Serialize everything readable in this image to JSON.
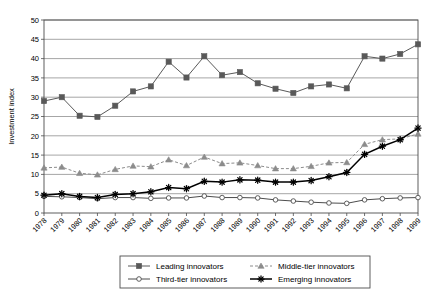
{
  "chart_data": {
    "type": "line",
    "title": "",
    "xlabel": "",
    "ylabel": "Investment index",
    "ylim": [
      0,
      50
    ],
    "ytick_step": 5,
    "grid": true,
    "legend_position": "bottom",
    "categories": [
      "1978",
      "1979",
      "1980",
      "1981",
      "1982",
      "1983",
      "1984",
      "1985",
      "1986",
      "1987",
      "1988",
      "1989",
      "1990",
      "1991",
      "1992",
      "1993",
      "1994",
      "1995",
      "1996",
      "1997",
      "1998",
      "1999"
    ],
    "yticks": [
      "0",
      "5",
      "10",
      "15",
      "20",
      "25",
      "30",
      "35",
      "40",
      "45",
      "50"
    ],
    "series": [
      {
        "name": "Leading innovators",
        "marker": "square",
        "color": "#595959",
        "linestyle": "solid",
        "values": [
          29.0,
          30.0,
          25.2,
          24.9,
          27.8,
          31.5,
          32.8,
          39.2,
          35.1,
          40.6,
          35.7,
          36.5,
          33.6,
          32.2,
          31.1,
          32.8,
          33.3,
          32.3,
          40.6,
          40.0,
          41.2,
          43.7
        ]
      },
      {
        "name": "Middle-tier innovators",
        "marker": "triangle",
        "color": "#8c8c8c",
        "linestyle": "dashed",
        "values": [
          11.7,
          11.9,
          10.3,
          9.9,
          11.3,
          12.2,
          12.0,
          13.8,
          12.3,
          14.5,
          12.8,
          13.0,
          12.3,
          11.5,
          11.5,
          12.1,
          13.0,
          13.1,
          17.8,
          19.0,
          19.2,
          20.5
        ]
      },
      {
        "name": "Third-tier innovators",
        "marker": "circle-open",
        "color": "#4d4d4d",
        "linestyle": "solid",
        "values": [
          4.3,
          4.2,
          4.0,
          3.7,
          4.0,
          4.0,
          3.8,
          3.9,
          3.9,
          4.4,
          4.0,
          4.0,
          3.9,
          3.4,
          3.1,
          2.8,
          2.6,
          2.5,
          3.4,
          3.7,
          3.9,
          4.0
        ]
      },
      {
        "name": "Emerging innovators",
        "marker": "star",
        "color": "#000000",
        "linestyle": "solid",
        "values": [
          4.6,
          5.0,
          4.3,
          4.0,
          4.8,
          5.0,
          5.5,
          6.6,
          6.3,
          8.2,
          8.0,
          8.6,
          8.5,
          8.0,
          8.0,
          8.4,
          9.4,
          10.5,
          15.2,
          17.3,
          19.0,
          22.0
        ]
      }
    ]
  },
  "legend": {
    "entries": [
      {
        "label": "Leading innovators"
      },
      {
        "label": "Middle-tier innovators"
      },
      {
        "label": "Third-tier innovators"
      },
      {
        "label": "Emerging innovators"
      }
    ]
  }
}
